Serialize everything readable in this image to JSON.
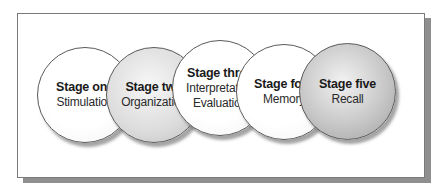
{
  "diagram": {
    "type": "overlapping-circles-sequence",
    "stages": [
      {
        "title": "Stage one",
        "lines": [
          "Stimulation"
        ],
        "fill": "#ffffff"
      },
      {
        "title": "Stage two",
        "lines": [
          "Organization"
        ],
        "fill": "#d6d6d6"
      },
      {
        "title": "Stage three",
        "lines": [
          "Interpretation",
          "Evaluation"
        ],
        "fill": "#ffffff"
      },
      {
        "title": "Stage four",
        "lines": [
          "Memory"
        ],
        "fill": "#ffffff"
      },
      {
        "title": "Stage five",
        "lines": [
          "Recall"
        ],
        "fill": "#bdbdbd"
      }
    ]
  }
}
